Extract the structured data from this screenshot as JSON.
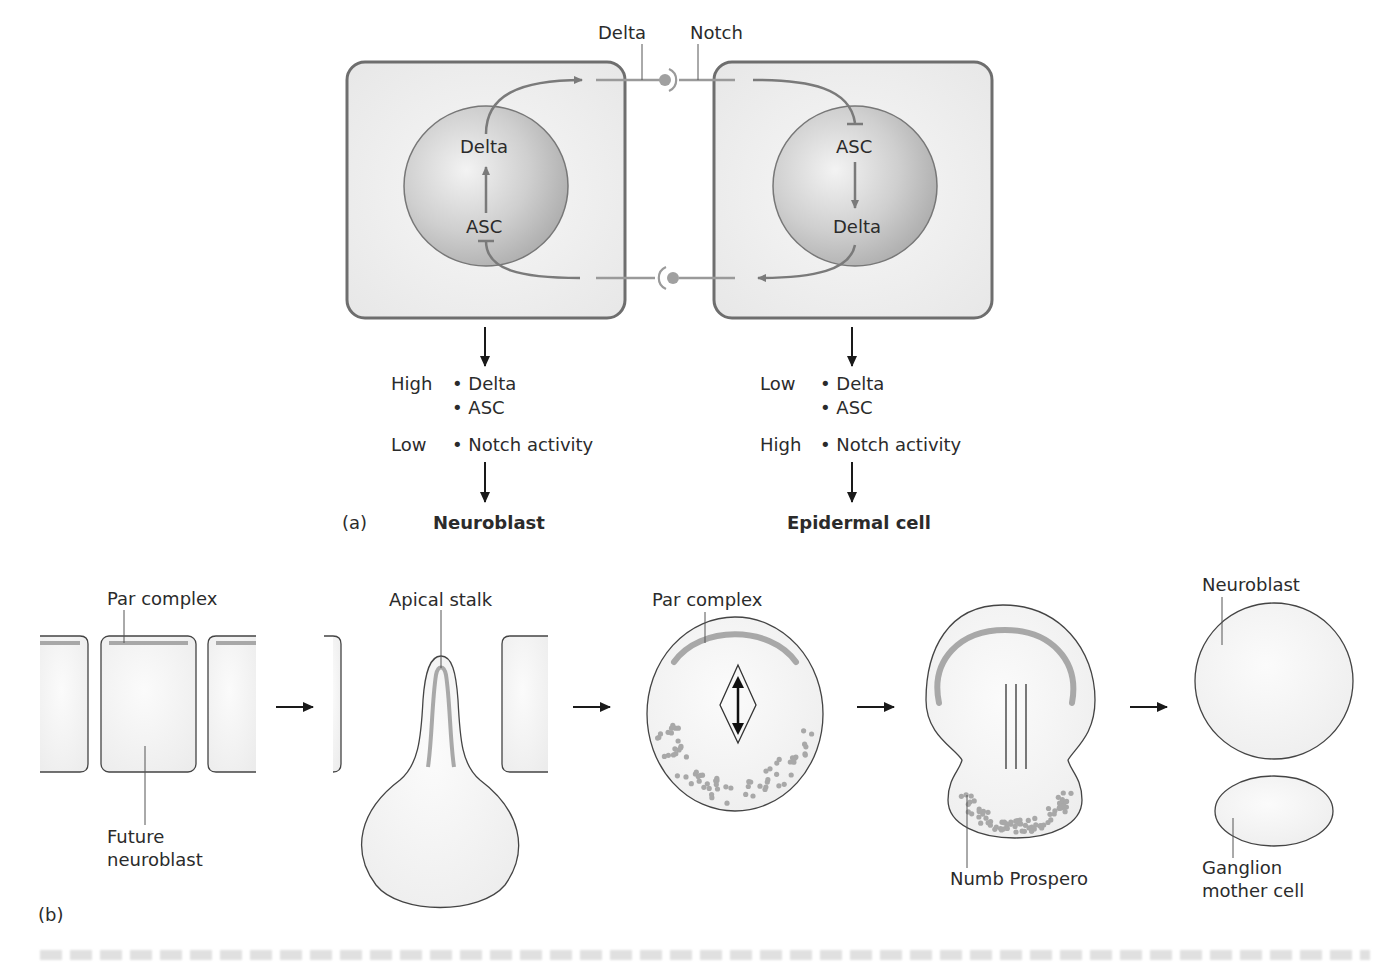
{
  "panel_a": {
    "panel_label": "(a)",
    "top_labels": {
      "delta": "Delta",
      "notch": "Notch"
    },
    "left_cell": {
      "nucleus_top": "Delta",
      "nucleus_bottom": "ASC",
      "levels": [
        {
          "level": "High",
          "items": [
            "• Delta",
            "• ASC"
          ]
        },
        {
          "level": "Low",
          "items": [
            "• Notch activity"
          ]
        }
      ],
      "fate": "Neuroblast"
    },
    "right_cell": {
      "nucleus_top": "ASC",
      "nucleus_bottom": "Delta",
      "levels": [
        {
          "level": "Low",
          "items": [
            "• Delta",
            "• ASC"
          ]
        },
        {
          "level": "High",
          "items": [
            "• Notch activity"
          ]
        }
      ],
      "fate": "Epidermal cell"
    }
  },
  "panel_b": {
    "panel_label": "(b)",
    "stages": [
      {
        "labels": [
          "Par complex",
          "Future",
          "neuroblast"
        ]
      },
      {
        "labels": [
          "Apical stalk"
        ]
      },
      {
        "labels": [
          "Par complex"
        ]
      },
      {
        "labels": [
          "Numb Prospero"
        ]
      },
      {
        "labels": [
          "Neuroblast",
          "Ganglion",
          "mother cell"
        ]
      }
    ]
  },
  "colors": {
    "cell_border": "#6e6e6e",
    "cell_fill": "#ececec",
    "nucleus_fill": "#bdbdbd",
    "pathway": "#7a7a7a",
    "par_complex": "#a8a8a8",
    "numb_dots": "#a8a8a8",
    "arrow": "#1a1a1a"
  }
}
